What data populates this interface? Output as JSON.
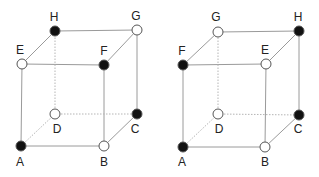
{
  "colors": {
    "filled": "#111111",
    "empty": "#ffffff",
    "edge": "#9a9a9a",
    "label": "#222222"
  },
  "cubes": [
    {
      "name": "left-cube",
      "vertices": {
        "A": {
          "x": 21,
          "y": 146,
          "filled": true,
          "label": "A",
          "lx": 20,
          "ly": 166
        },
        "B": {
          "x": 104,
          "y": 146,
          "filled": false,
          "label": "B",
          "lx": 104,
          "ly": 166
        },
        "C": {
          "x": 137,
          "y": 114,
          "filled": true,
          "label": "C",
          "lx": 135,
          "ly": 133
        },
        "D": {
          "x": 55,
          "y": 114,
          "filled": false,
          "label": "D",
          "lx": 57,
          "ly": 133
        },
        "E": {
          "x": 22,
          "y": 64,
          "filled": false,
          "label": "E",
          "lx": 20,
          "ly": 54
        },
        "F": {
          "x": 104,
          "y": 65,
          "filled": true,
          "label": "F",
          "lx": 104,
          "ly": 55
        },
        "H": {
          "x": 55,
          "y": 31,
          "filled": true,
          "label": "H",
          "lx": 54,
          "ly": 21
        },
        "G": {
          "x": 137,
          "y": 30,
          "filled": false,
          "label": "G",
          "lx": 136,
          "ly": 20
        }
      },
      "edges": [
        [
          "A",
          "B",
          false
        ],
        [
          "B",
          "C",
          false
        ],
        [
          "A",
          "E",
          false
        ],
        [
          "B",
          "F",
          false
        ],
        [
          "C",
          "G",
          false
        ],
        [
          "E",
          "F",
          false
        ],
        [
          "F",
          "G",
          false
        ],
        [
          "G",
          "H",
          false
        ],
        [
          "H",
          "E",
          false
        ],
        [
          "A",
          "D",
          true
        ],
        [
          "D",
          "C",
          true
        ],
        [
          "D",
          "H",
          true
        ]
      ]
    },
    {
      "name": "right-cube",
      "vertices": {
        "A": {
          "x": 183,
          "y": 147,
          "filled": true,
          "label": "A",
          "lx": 182,
          "ly": 166
        },
        "B": {
          "x": 265,
          "y": 147,
          "filled": false,
          "label": "B",
          "lx": 265,
          "ly": 166
        },
        "C": {
          "x": 299,
          "y": 115,
          "filled": true,
          "label": "C",
          "lx": 298,
          "ly": 133
        },
        "D": {
          "x": 218,
          "y": 114,
          "filled": false,
          "label": "D",
          "lx": 219,
          "ly": 133
        },
        "F": {
          "x": 183,
          "y": 65,
          "filled": true,
          "label": "F",
          "lx": 182,
          "ly": 55
        },
        "E": {
          "x": 266,
          "y": 64,
          "filled": false,
          "label": "E",
          "lx": 265,
          "ly": 54
        },
        "G": {
          "x": 218,
          "y": 32,
          "filled": false,
          "label": "G",
          "lx": 216,
          "ly": 21
        },
        "H": {
          "x": 299,
          "y": 31,
          "filled": true,
          "label": "H",
          "lx": 298,
          "ly": 21
        }
      },
      "edges": [
        [
          "A",
          "B",
          false
        ],
        [
          "B",
          "C",
          false
        ],
        [
          "A",
          "F",
          false
        ],
        [
          "B",
          "E",
          false
        ],
        [
          "C",
          "H",
          false
        ],
        [
          "F",
          "E",
          false
        ],
        [
          "E",
          "H",
          false
        ],
        [
          "H",
          "G",
          false
        ],
        [
          "G",
          "F",
          false
        ],
        [
          "A",
          "D",
          true
        ],
        [
          "D",
          "C",
          true
        ],
        [
          "D",
          "G",
          true
        ]
      ]
    }
  ]
}
